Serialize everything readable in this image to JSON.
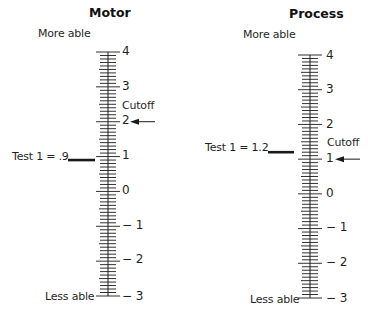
{
  "panels": [
    {
      "id": "motor",
      "title": "Motor",
      "top_label": "More able",
      "bottom_label": "Less able",
      "cutoff_label": "Cutoff",
      "cutoff_value": 2,
      "test_label": "Test 1 = .9",
      "test_value": 0.9,
      "scale": {
        "max": 4,
        "min": -3,
        "minor_per_unit": 10
      },
      "tick_labels": [
        "4",
        "3",
        "2",
        "1",
        "0",
        "− 1",
        "− 2",
        "− 3"
      ]
    },
    {
      "id": "process",
      "title": "Process",
      "top_label": "More able",
      "bottom_label": "Less able",
      "cutoff_label": "Cutoff",
      "cutoff_value": 1,
      "test_label": "Test 1 = 1.2",
      "test_value": 1.2,
      "scale": {
        "max": 4,
        "min": -3,
        "minor_per_unit": 10
      },
      "tick_labels": [
        "4",
        "3",
        "2",
        "1",
        "0",
        "− 1",
        "− 2",
        "− 3"
      ]
    }
  ],
  "colors": {
    "ink": "#1a1a1a",
    "background": "#ffffff"
  }
}
